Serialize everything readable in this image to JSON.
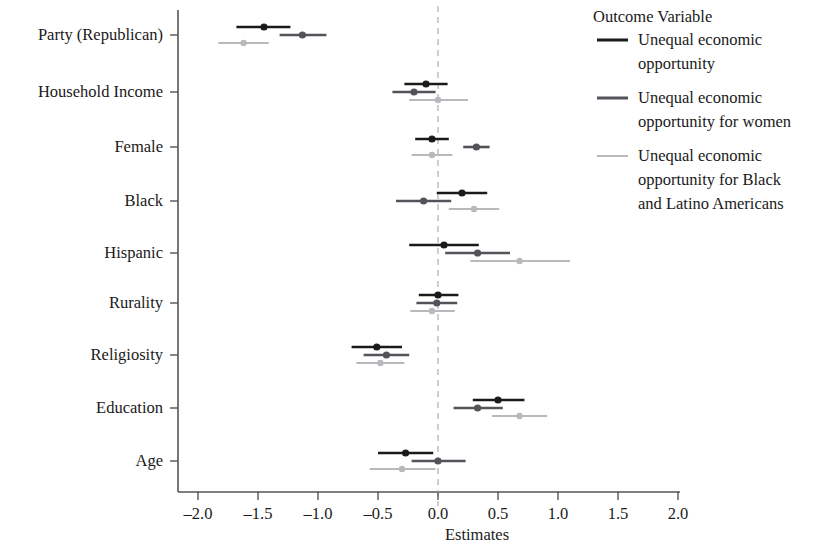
{
  "figure": {
    "kind": "coefficient-plot",
    "background": "#ffffff"
  },
  "axis": {
    "x_title": "Estimates",
    "x_ticks": [
      "-2.0",
      "-1.5",
      "-1.0",
      "-0.5",
      "0.0",
      "0.5",
      "1.0",
      "1.5",
      "2.0"
    ],
    "y_labels": [
      "Party (Republican)",
      "Household Income",
      "Female",
      "Black",
      "Hispanic",
      "Rurality",
      "Religiosity",
      "Education",
      "Age"
    ],
    "zero_reference": "0.0"
  },
  "legend": {
    "title": "Outcome Variable",
    "entries": [
      {
        "label": "Unequal economic opportunity",
        "color": "#1a1a1a"
      },
      {
        "label": "Unequal economic opportunity for women",
        "color": "#53535a"
      },
      {
        "label": "Unequal economic opportunity for Black and Latino Americans",
        "color": "#b9b9bd"
      }
    ]
  },
  "chart_data": {
    "type": "scatter",
    "title": "",
    "subtitle": "",
    "xlabel": "Estimates",
    "ylabel": "",
    "xlim": [
      -2.2,
      2.2
    ],
    "grid": false,
    "legend_position": "right",
    "legend_title": "Outcome Variable",
    "zero_line": 0.0,
    "categories": [
      "Party (Republican)",
      "Household Income",
      "Female",
      "Black",
      "Hispanic",
      "Rurality",
      "Religiosity",
      "Education",
      "Age"
    ],
    "series": [
      {
        "name": "Unequal economic opportunity",
        "color": "#1a1a1a",
        "values": [
          -1.45,
          -0.1,
          -0.05,
          0.2,
          0.05,
          0.0,
          -0.51,
          0.5,
          -0.27
        ],
        "ci_low": [
          -1.68,
          -0.28,
          -0.19,
          -0.01,
          -0.24,
          -0.16,
          -0.72,
          0.29,
          -0.5
        ],
        "ci_high": [
          -1.23,
          0.08,
          0.09,
          0.41,
          0.34,
          0.17,
          -0.3,
          0.72,
          -0.04
        ]
      },
      {
        "name": "Unequal economic opportunity for women",
        "color": "#53535a",
        "values": [
          -1.13,
          -0.2,
          0.32,
          -0.12,
          0.33,
          -0.01,
          -0.43,
          0.33,
          0.0
        ],
        "ci_low": [
          -1.32,
          -0.38,
          0.21,
          -0.35,
          0.06,
          -0.18,
          -0.62,
          0.13,
          -0.22
        ],
        "ci_high": [
          -0.93,
          -0.02,
          0.43,
          0.11,
          0.6,
          0.16,
          -0.24,
          0.54,
          0.23
        ]
      },
      {
        "name": "Unequal economic opportunity for Black and Latino Americans",
        "color": "#b9b9bd",
        "values": [
          -1.62,
          0.0,
          -0.05,
          0.3,
          0.68,
          -0.05,
          -0.48,
          0.68,
          -0.3
        ],
        "ci_low": [
          -1.83,
          -0.24,
          -0.22,
          0.09,
          0.27,
          -0.23,
          -0.68,
          0.45,
          -0.57
        ],
        "ci_high": [
          -1.41,
          0.25,
          0.12,
          0.51,
          1.1,
          0.14,
          -0.28,
          0.91,
          -0.02
        ]
      }
    ]
  }
}
